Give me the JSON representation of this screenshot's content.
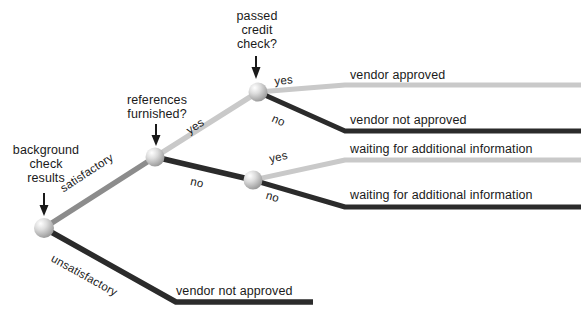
{
  "diagram": {
    "type": "decision-tree",
    "title_visible": false,
    "background_color": "#ffffff",
    "text_color": "#1a1a1a",
    "colors": {
      "dark_branch": "#2b2b2b",
      "mid_branch": "#8c8c8c",
      "light_branch": "#c9c9c9",
      "node_fill": "#b8b8b8",
      "node_highlight": "#f2f2f2"
    },
    "decision_nodes": [
      {
        "id": "background-check-results",
        "label_lines": [
          "background",
          "check",
          "results"
        ],
        "label_text": "background check results",
        "x": 44,
        "y": 228,
        "pointer": "down-arrow"
      },
      {
        "id": "references-furnished",
        "label_lines": [
          "references",
          "furnished?"
        ],
        "label_text": "references furnished?",
        "x": 155,
        "y": 157,
        "pointer": "down-arrow"
      },
      {
        "id": "passed-credit-check",
        "label_lines": [
          "passed",
          "credit",
          "check?"
        ],
        "label_text": "passed credit check?",
        "x": 258,
        "y": 92,
        "pointer": "down-arrow"
      },
      {
        "id": "unlabeled-lower-node",
        "label_lines": [],
        "label_text": "",
        "x": 253,
        "y": 180,
        "pointer": "none"
      }
    ],
    "edge_labels": {
      "satisfactory": "satisfactory",
      "unsatisfactory": "unsatisfactory",
      "refs_yes": "yes",
      "refs_no": "no",
      "credit_yes": "yes",
      "credit_no": "no",
      "lower_yes": "yes",
      "lower_no": "no"
    },
    "outcomes": [
      {
        "id": "outcome-vendor-approved",
        "label": "vendor approved",
        "path": [
          "satisfactory",
          "yes",
          "yes"
        ],
        "branch_shade": "light",
        "text_x": 350,
        "text_y": 68
      },
      {
        "id": "outcome-vendor-not-approved-credit",
        "label": "vendor not approved",
        "path": [
          "satisfactory",
          "yes",
          "no"
        ],
        "branch_shade": "dark",
        "text_x": 350,
        "text_y": 113
      },
      {
        "id": "outcome-waiting-info-yes",
        "label": "waiting for additional information",
        "path": [
          "satisfactory",
          "no",
          "yes"
        ],
        "branch_shade": "light",
        "text_x": 350,
        "text_y": 142
      },
      {
        "id": "outcome-waiting-info-no",
        "label": "waiting for additional information",
        "path": [
          "satisfactory",
          "no",
          "no"
        ],
        "branch_shade": "dark",
        "text_x": 350,
        "text_y": 188
      },
      {
        "id": "outcome-vendor-not-approved-background",
        "label": "vendor not approved",
        "path": [
          "unsatisfactory"
        ],
        "branch_shade": "dark",
        "text_x": 176,
        "text_y": 285
      }
    ]
  }
}
